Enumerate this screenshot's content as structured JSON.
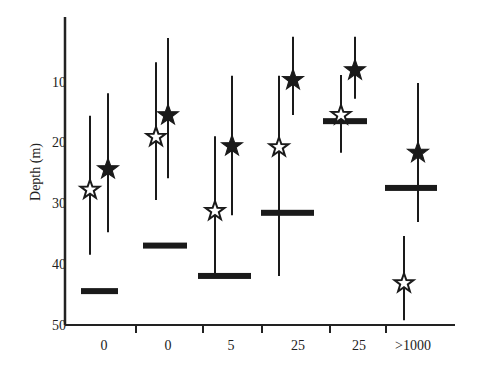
{
  "chart_data": {
    "type": "scatter",
    "title": "",
    "xlabel": "",
    "ylabel": "Depth (m)",
    "ylim": [
      50,
      0
    ],
    "y_inverted": true,
    "yticks": [
      10,
      20,
      30,
      40,
      50
    ],
    "grid": false,
    "legend": null,
    "categories": [
      "0",
      "0",
      "5",
      "25",
      "25",
      ">1000"
    ],
    "series": [
      {
        "name": "open-star",
        "marker": "star-hollow",
        "values": [
          27.8,
          19.1,
          31.3,
          20.8,
          15.5,
          43.2
        ],
        "range_low": [
          15.6,
          6.8,
          19.0,
          9.0,
          8.9,
          35.4
        ],
        "range_high": [
          38.5,
          29.5,
          42.0,
          42.0,
          21.7,
          49.3
        ]
      },
      {
        "name": "filled-star",
        "marker": "star-filled",
        "values": [
          24.4,
          15.5,
          20.6,
          9.7,
          8.1,
          21.7
        ],
        "range_low": [
          11.9,
          2.8,
          9.0,
          2.6,
          2.6,
          10.2
        ],
        "range_high": [
          34.8,
          25.9,
          32.0,
          15.5,
          12.8,
          33.1
        ]
      },
      {
        "name": "bar-marker",
        "marker": "horizontal-bar",
        "values": [
          44.5,
          37.0,
          42.0,
          31.6,
          16.5,
          27.5
        ]
      }
    ]
  },
  "axes": {
    "y_label": "Depth (m)",
    "y_ticks": [
      "10",
      "20",
      "30",
      "40",
      "50"
    ],
    "x_labels": [
      "0",
      "0",
      "5",
      "25",
      "25",
      ">1000"
    ]
  }
}
